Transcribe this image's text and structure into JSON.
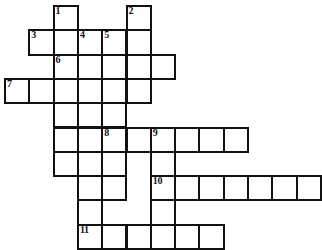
{
  "puzzle": {
    "kind": "crossword-grid",
    "title": "Crossword puzzle grid",
    "columns": 12,
    "rows": 10,
    "cell_size": 24.3,
    "origin_x": 4,
    "origin_y": 5,
    "ink_color": "#111111",
    "cell_fill": "#ffffff",
    "background": "#ffffff",
    "border_width": 2
  },
  "numbers": {
    "n1": "1",
    "n2": "2",
    "n3": "3",
    "n4": "4",
    "n5": "5",
    "n6": "6",
    "n7": "7",
    "n8": "8",
    "n9": "9",
    "n10": "10",
    "n11": "11"
  },
  "entries": [
    {
      "number": "1",
      "direction": "down",
      "start_col": 2,
      "start_row": 0,
      "length": 8
    },
    {
      "number": "2",
      "direction": "down",
      "start_col": 5,
      "start_row": 0,
      "length": 4
    },
    {
      "number": "3",
      "direction": "across",
      "start_col": 1,
      "start_row": 1,
      "length": 5
    },
    {
      "number": "4",
      "direction": "down",
      "start_col": 3,
      "start_row": 1,
      "length": 7
    },
    {
      "number": "5",
      "direction": "down",
      "start_col": 4,
      "start_row": 1,
      "length": 7
    },
    {
      "number": "6",
      "direction": "across",
      "start_col": 2,
      "start_row": 2,
      "length": 5
    },
    {
      "number": "7",
      "direction": "across",
      "start_col": 0,
      "start_row": 3,
      "length": 6
    },
    {
      "number": "8",
      "direction": "across",
      "start_col": 4,
      "start_row": 5,
      "length": 6
    },
    {
      "number": "9",
      "direction": "down",
      "start_col": 6,
      "start_row": 5,
      "length": 4
    },
    {
      "number": "10",
      "direction": "across",
      "start_col": 6,
      "start_row": 7,
      "length": 7
    },
    {
      "number": "11",
      "direction": "across",
      "start_col": 3,
      "start_row": 9,
      "length": 6
    }
  ],
  "cells": [
    {
      "col": 2,
      "row": 0,
      "number": "1",
      "letter": ""
    },
    {
      "col": 5,
      "row": 0,
      "number": "2",
      "letter": ""
    },
    {
      "col": 1,
      "row": 1,
      "number": "3",
      "letter": ""
    },
    {
      "col": 2,
      "row": 1,
      "number": "",
      "letter": ""
    },
    {
      "col": 3,
      "row": 1,
      "number": "4",
      "letter": ""
    },
    {
      "col": 4,
      "row": 1,
      "number": "5",
      "letter": ""
    },
    {
      "col": 5,
      "row": 1,
      "number": "",
      "letter": ""
    },
    {
      "col": 2,
      "row": 2,
      "number": "6",
      "letter": ""
    },
    {
      "col": 3,
      "row": 2,
      "number": "",
      "letter": ""
    },
    {
      "col": 4,
      "row": 2,
      "number": "",
      "letter": ""
    },
    {
      "col": 5,
      "row": 2,
      "number": "",
      "letter": ""
    },
    {
      "col": 6,
      "row": 2,
      "number": "",
      "letter": ""
    },
    {
      "col": 0,
      "row": 3,
      "number": "7",
      "letter": ""
    },
    {
      "col": 1,
      "row": 3,
      "number": "",
      "letter": ""
    },
    {
      "col": 2,
      "row": 3,
      "number": "",
      "letter": ""
    },
    {
      "col": 3,
      "row": 3,
      "number": "",
      "letter": ""
    },
    {
      "col": 4,
      "row": 3,
      "number": "",
      "letter": ""
    },
    {
      "col": 5,
      "row": 3,
      "number": "",
      "letter": ""
    },
    {
      "col": 2,
      "row": 4,
      "number": "",
      "letter": ""
    },
    {
      "col": 3,
      "row": 4,
      "number": "",
      "letter": ""
    },
    {
      "col": 4,
      "row": 4,
      "number": "",
      "letter": ""
    },
    {
      "col": 2,
      "row": 5,
      "number": "",
      "letter": ""
    },
    {
      "col": 3,
      "row": 5,
      "number": "",
      "letter": ""
    },
    {
      "col": 4,
      "row": 5,
      "number": "8",
      "letter": ""
    },
    {
      "col": 5,
      "row": 5,
      "number": "",
      "letter": ""
    },
    {
      "col": 6,
      "row": 5,
      "number": "9",
      "letter": ""
    },
    {
      "col": 7,
      "row": 5,
      "number": "",
      "letter": ""
    },
    {
      "col": 8,
      "row": 5,
      "number": "",
      "letter": ""
    },
    {
      "col": 9,
      "row": 5,
      "number": "",
      "letter": ""
    },
    {
      "col": 2,
      "row": 6,
      "number": "",
      "letter": ""
    },
    {
      "col": 3,
      "row": 6,
      "number": "",
      "letter": ""
    },
    {
      "col": 4,
      "row": 6,
      "number": "",
      "letter": ""
    },
    {
      "col": 6,
      "row": 6,
      "number": "",
      "letter": ""
    },
    {
      "col": 3,
      "row": 7,
      "number": "",
      "letter": ""
    },
    {
      "col": 4,
      "row": 7,
      "number": "",
      "letter": ""
    },
    {
      "col": 6,
      "row": 7,
      "number": "10",
      "letter": ""
    },
    {
      "col": 7,
      "row": 7,
      "number": "",
      "letter": ""
    },
    {
      "col": 8,
      "row": 7,
      "number": "",
      "letter": ""
    },
    {
      "col": 9,
      "row": 7,
      "number": "",
      "letter": ""
    },
    {
      "col": 10,
      "row": 7,
      "number": "",
      "letter": ""
    },
    {
      "col": 11,
      "row": 7,
      "number": "",
      "letter": ""
    },
    {
      "col": 12,
      "row": 7,
      "number": "",
      "letter": ""
    },
    {
      "col": 3,
      "row": 8,
      "number": "",
      "letter": ""
    },
    {
      "col": 6,
      "row": 8,
      "number": "",
      "letter": ""
    },
    {
      "col": 3,
      "row": 9,
      "number": "11",
      "letter": ""
    },
    {
      "col": 4,
      "row": 9,
      "number": "",
      "letter": ""
    },
    {
      "col": 5,
      "row": 9,
      "number": "",
      "letter": ""
    },
    {
      "col": 6,
      "row": 9,
      "number": "",
      "letter": ""
    },
    {
      "col": 7,
      "row": 9,
      "number": "",
      "letter": ""
    },
    {
      "col": 8,
      "row": 9,
      "number": "",
      "letter": ""
    }
  ]
}
